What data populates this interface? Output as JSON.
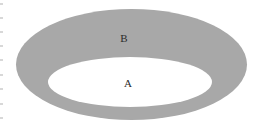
{
  "figure": {
    "type": "annulus-diagram",
    "background_color": "#ffffff",
    "width": 259,
    "height": 130
  },
  "shapes": {
    "outer_ellipse": {
      "name": "outer-ellipse",
      "fill_color": "#a8a8a8",
      "cx": 131.5,
      "cy": 64.5,
      "rx": 115.5,
      "ry": 55.5
    },
    "inner_ellipse": {
      "name": "inner-ellipse",
      "fill_color": "#ffffff",
      "cx": 130,
      "cy": 82,
      "rx": 82,
      "ry": 25
    }
  },
  "labels": {
    "outer_region": {
      "text": "B",
      "color": "#2b2b2b",
      "x": 124,
      "y": 38
    },
    "inner_region": {
      "text": "A",
      "color": "#2b2b2b",
      "x": 128,
      "y": 83
    }
  },
  "edge_artifacts": {
    "description": "faint cropped-text fragments at left margin",
    "color": "#d8d8d8",
    "positions": [
      3,
      17,
      31,
      45,
      59,
      74,
      88,
      103,
      117
    ]
  },
  "chart_data": {
    "type": "diagram",
    "regions": [
      {
        "label": "B",
        "description": "gray annular ring region",
        "color": "#a8a8a8"
      },
      {
        "label": "A",
        "description": "inner white elliptical region",
        "color": "#ffffff"
      }
    ]
  }
}
